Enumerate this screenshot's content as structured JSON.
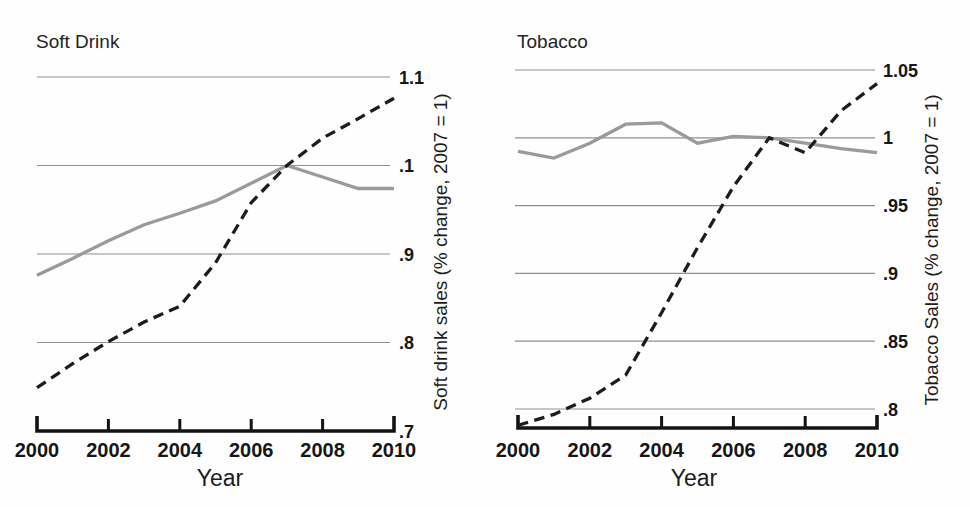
{
  "figure": {
    "background": "#ffffff",
    "description_colors": {
      "dashed_line": "#1c1c1c",
      "solid_line": "#9a9a9a",
      "gridline": "#8f8f8f"
    }
  },
  "chart_data": [
    {
      "type": "line",
      "title": "Soft Drink",
      "xlabel": "Year",
      "ylabel": "Soft drink sales (% change, 2007 = 1)",
      "grid": "horizontal",
      "legend_position": "none",
      "x_range": [
        2000,
        2010
      ],
      "x": [
        2000,
        2001,
        2002,
        2003,
        2004,
        2005,
        2006,
        2007,
        2008,
        2009,
        2010
      ],
      "xticks": [
        {
          "year": 2000,
          "label": "2000"
        },
        {
          "year": 2002,
          "label": "2002"
        },
        {
          "year": 2004,
          "label": "2004"
        },
        {
          "year": 2006,
          "label": "2006"
        },
        {
          "year": 2008,
          "label": "2008"
        },
        {
          "year": 2010,
          "label": "2010"
        }
      ],
      "yticks": [
        {
          "value": 1.1,
          "label": "1.1",
          "gridline": true
        },
        {
          "value": 1.0,
          "label": ".1",
          "gridline": true
        },
        {
          "value": 0.9,
          "label": ".9",
          "gridline": true
        },
        {
          "value": 0.8,
          "label": ".8",
          "gridline": true
        },
        {
          "value": 0.7,
          "label": ".7",
          "gridline": false
        }
      ],
      "series": [
        {
          "name": "soft-drink-dashed-black",
          "style": "dashed",
          "color": "#1c1c1c",
          "values": [
            0.749,
            0.776,
            0.801,
            0.823,
            0.841,
            0.89,
            0.958,
            1.0,
            1.031,
            1.053,
            1.076
          ]
        },
        {
          "name": "comparison-solid-gray",
          "style": "solid",
          "color": "#9a9a9a",
          "values": [
            0.876,
            0.895,
            0.915,
            0.933,
            0.946,
            0.96,
            0.98,
            1.0,
            0.987,
            0.974,
            0.974
          ]
        }
      ]
    },
    {
      "type": "line",
      "title": "Tobacco",
      "xlabel": "Year",
      "ylabel": "Tobacco Sales (% change, 2007 = 1)",
      "grid": "horizontal",
      "legend_position": "none",
      "x_range": [
        2000,
        2010
      ],
      "x": [
        2000,
        2001,
        2002,
        2003,
        2004,
        2005,
        2006,
        2007,
        2008,
        2009,
        2010
      ],
      "xticks": [
        {
          "year": 2000,
          "label": "2000"
        },
        {
          "year": 2002,
          "label": "2002"
        },
        {
          "year": 2004,
          "label": "2004"
        },
        {
          "year": 2006,
          "label": "2006"
        },
        {
          "year": 2008,
          "label": "2008"
        },
        {
          "year": 2010,
          "label": "2010"
        }
      ],
      "yticks": [
        {
          "value": 1.05,
          "label": "1.05",
          "gridline": true
        },
        {
          "value": 1.0,
          "label": "1",
          "gridline": true
        },
        {
          "value": 0.95,
          "label": ".95",
          "gridline": true
        },
        {
          "value": 0.9,
          "label": ".9",
          "gridline": true
        },
        {
          "value": 0.85,
          "label": ".85",
          "gridline": true
        },
        {
          "value": 0.8,
          "label": ".8",
          "gridline": true
        }
      ],
      "series": [
        {
          "name": "tobacco-dashed-black",
          "style": "dashed",
          "color": "#1c1c1c",
          "values": [
            0.788,
            0.796,
            0.808,
            0.825,
            0.871,
            0.919,
            0.964,
            1.0,
            0.989,
            1.02,
            1.04
          ]
        },
        {
          "name": "comparison-solid-gray",
          "style": "solid",
          "color": "#9a9a9a",
          "values": [
            0.99,
            0.985,
            0.996,
            1.01,
            1.011,
            0.996,
            1.001,
            1.0,
            0.996,
            0.992,
            0.989
          ]
        }
      ]
    }
  ]
}
